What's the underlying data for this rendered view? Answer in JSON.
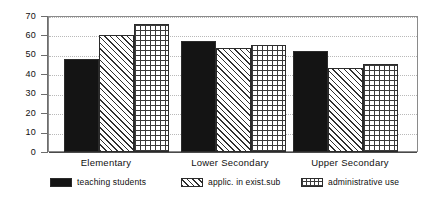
{
  "chart_data": {
    "type": "bar",
    "title": "",
    "subtitle": "",
    "xlabel": "",
    "ylabel": "",
    "categories": [
      "Elementary",
      "Lower Secondary",
      "Upper Secondary"
    ],
    "series": [
      {
        "name": "teaching students",
        "pattern": "solid-black",
        "values": [
          48,
          57,
          52
        ]
      },
      {
        "name": "applic. in exist.sub",
        "pattern": "diagonal-hatch",
        "values": [
          60,
          53.5,
          43.5
        ]
      },
      {
        "name": "administrative use",
        "pattern": "crosshatch-grid",
        "values": [
          66,
          55,
          45.5
        ]
      }
    ],
    "ylim": [
      0,
      70
    ],
    "ytick_step": 10,
    "ytick_labels": [
      "70",
      "60",
      "50",
      "40",
      "30",
      "20",
      "10",
      "0"
    ],
    "ytick_values": [
      70,
      60,
      50,
      40,
      30,
      20,
      10,
      0
    ],
    "grid": "horizontal-dotted",
    "legend_position": "bottom",
    "bar_gap_within_group": 0,
    "colors": {
      "series_1": "#141414",
      "series_2_lines": "#303030",
      "series_3_lines": "#3a3a3a",
      "background": "#ffffff",
      "axis": "#6d6d6d",
      "gridline": "#b9b9b9",
      "text": "#101010"
    }
  },
  "legend": {
    "items": [
      {
        "label": "teaching students"
      },
      {
        "label": "applic. in exist.sub"
      },
      {
        "label": "administrative use"
      }
    ]
  }
}
